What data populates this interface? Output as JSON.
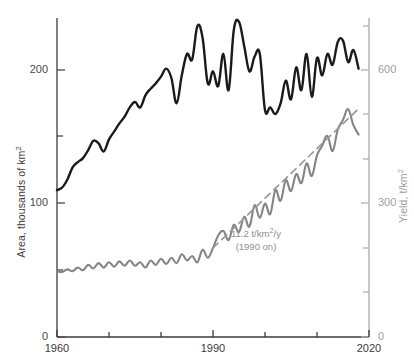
{
  "chart_data": {
    "type": "line",
    "title": "",
    "xlabel": "",
    "ylabel": "Area, thousands of km2",
    "y2label": "Yield, t/km2",
    "xlim": [
      1960,
      2020
    ],
    "ylim_left": [
      0,
      250
    ],
    "ylim_right": [
      0,
      750
    ],
    "grid": false,
    "legend": "none",
    "x_ticks_major": [
      1960,
      1990,
      2020
    ],
    "x_ticks_minor": [
      1970,
      1980,
      2000,
      2010
    ],
    "y_left_ticks_major": [
      0,
      100,
      200
    ],
    "y_left_ticks_minor": [
      50,
      150
    ],
    "y_right_ticks_major": [
      0,
      300,
      600
    ],
    "y_right_ticks_minor": [
      100,
      200,
      400,
      500,
      700
    ],
    "series": [
      {
        "name": "Area",
        "axis": "left",
        "color": "#1a1a1a",
        "units": "thousands of km2",
        "x": [
          1960,
          1961,
          1962,
          1963,
          1964,
          1965,
          1966,
          1967,
          1968,
          1969,
          1970,
          1971,
          1972,
          1973,
          1974,
          1975,
          1976,
          1977,
          1978,
          1979,
          1980,
          1981,
          1982,
          1983,
          1984,
          1985,
          1986,
          1987,
          1988,
          1989,
          1990,
          1991,
          1992,
          1993,
          1994,
          1995,
          1996,
          1997,
          1998,
          1999,
          2000,
          2001,
          2002,
          2003,
          2004,
          2005,
          2006,
          2007,
          2008,
          2009,
          2010,
          2011,
          2012,
          2013,
          2014,
          2015,
          2016,
          2017,
          2018
        ],
        "values": [
          110,
          112,
          118,
          127,
          131,
          134,
          140,
          147,
          145,
          139,
          148,
          154,
          160,
          165,
          172,
          176,
          172,
          181,
          186,
          190,
          195,
          201,
          194,
          175,
          196,
          212,
          208,
          233,
          224,
          190,
          199,
          188,
          212,
          185,
          230,
          236,
          218,
          199,
          210,
          212,
          170,
          172,
          167,
          175,
          192,
          178,
          202,
          185,
          212,
          180,
          209,
          196,
          212,
          204,
          221,
          222,
          206,
          215,
          201
        ]
      },
      {
        "name": "Yield",
        "axis": "right",
        "color": "#858585",
        "units": "t/km2",
        "x": [
          1960,
          1961,
          1962,
          1963,
          1964,
          1965,
          1966,
          1967,
          1968,
          1969,
          1970,
          1971,
          1972,
          1973,
          1974,
          1975,
          1976,
          1977,
          1978,
          1979,
          1980,
          1981,
          1982,
          1983,
          1984,
          1985,
          1986,
          1987,
          1988,
          1989,
          1990,
          1991,
          1992,
          1993,
          1994,
          1995,
          1996,
          1997,
          1998,
          1999,
          2000,
          2001,
          2002,
          2003,
          2004,
          2005,
          2006,
          2007,
          2008,
          2009,
          2010,
          2011,
          2012,
          2013,
          2014,
          2015,
          2016,
          2017,
          2018
        ],
        "values": [
          148,
          146,
          152,
          148,
          156,
          150,
          162,
          154,
          166,
          156,
          168,
          158,
          170,
          160,
          172,
          160,
          168,
          156,
          172,
          162,
          176,
          164,
          178,
          166,
          186,
          172,
          182,
          168,
          196,
          178,
          200,
          228,
          238,
          218,
          252,
          236,
          270,
          248,
          296,
          268,
          300,
          276,
          330,
          306,
          352,
          328,
          366,
          346,
          390,
          362,
          408,
          430,
          452,
          418,
          466,
          488,
          512,
          476,
          455
        ]
      },
      {
        "name": "Trend (1990 on)",
        "axis": "right",
        "style": "dashed",
        "color": "#9a9a9a",
        "slope": 11.2,
        "slope_units": "t/km2/y",
        "x": [
          1990,
          2018
        ],
        "values": [
          200,
          513
        ]
      }
    ],
    "annotations": [
      {
        "line1": "11.2 t/km2/y",
        "line2": "(1990 on)",
        "x": 2000,
        "y": 260
      }
    ]
  },
  "axes": {
    "left": {
      "title": "Area, thousands of km",
      "title_sup": "2",
      "labels": [
        "200",
        "100",
        "0"
      ]
    },
    "right": {
      "title": "Yield, t/km",
      "title_sup": "2",
      "labels": [
        "600",
        "300",
        "0"
      ]
    },
    "bottom": {
      "labels": [
        "1960",
        "1990",
        "2020"
      ]
    }
  },
  "annotation": {
    "value": "11.2 t/km",
    "sup": "2",
    "tail": "/y",
    "note": "(1990 on)"
  },
  "colors": {
    "area_series": "#1a1a1a",
    "yield_series": "#858585",
    "trend_line": "#9a9a9a",
    "left_axis": "#4a4a4a",
    "right_axis": "#b0b0b0",
    "background": "#ffffff"
  }
}
